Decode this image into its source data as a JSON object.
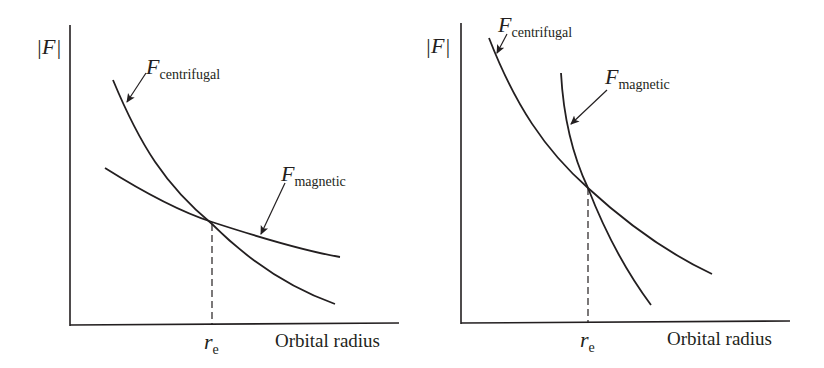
{
  "panels": [
    {
      "id": "left",
      "y_axis_label": "|F|",
      "x_axis_label": "Orbital radius",
      "equilibrium_label": {
        "symbol": "r",
        "subscript": "e"
      },
      "curves": [
        {
          "name": "F",
          "subscript": "centrifugal",
          "description": "steep decreasing curve"
        },
        {
          "name": "F",
          "subscript": "magnetic",
          "description": "shallow decreasing curve"
        }
      ]
    },
    {
      "id": "right",
      "y_axis_label": "|F|",
      "x_axis_label": "Orbital radius",
      "equilibrium_label": {
        "symbol": "r",
        "subscript": "e"
      },
      "curves": [
        {
          "name": "F",
          "subscript": "centrifugal",
          "description": "shallow decreasing curve"
        },
        {
          "name": "F",
          "subscript": "magnetic",
          "description": "steep decreasing curve"
        }
      ]
    }
  ],
  "colors": {
    "stroke": "#231f20",
    "background": "#ffffff"
  }
}
